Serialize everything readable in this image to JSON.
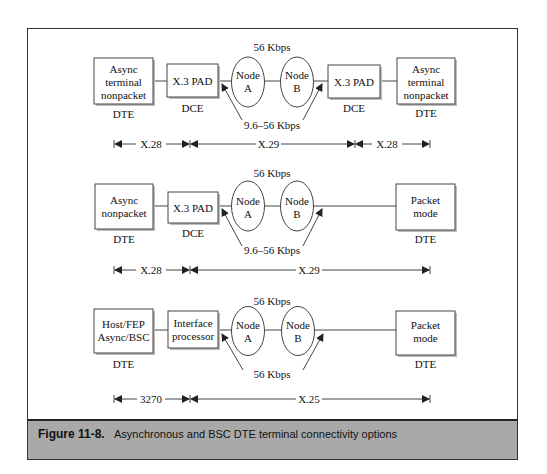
{
  "figure": {
    "number": "Figure 11-8.",
    "caption": "Asynchronous and BSC DTE terminal connectivity options"
  },
  "rows": [
    {
      "top_label": "56 Kbps",
      "access_label": "9.6–56 Kbps",
      "left_device": {
        "lines": [
          "Async",
          "terminal",
          "nonpacket"
        ],
        "role": "DTE"
      },
      "left_interface": {
        "lines": [
          "X.3 PAD"
        ],
        "role": "DCE"
      },
      "node_a": {
        "lines": [
          "Node",
          "A"
        ]
      },
      "node_b": {
        "lines": [
          "Node",
          "B"
        ]
      },
      "right_interface": {
        "lines": [
          "X.3 PAD"
        ],
        "role": "DCE"
      },
      "right_device": {
        "lines": [
          "Async",
          "terminal",
          "nonpacket"
        ],
        "role": "DTE"
      },
      "segments": [
        "X.28",
        "X.29",
        "X.28"
      ]
    },
    {
      "top_label": "56 Kbps",
      "access_label": "9.6–56 Kbps",
      "left_device": {
        "lines": [
          "Async",
          "nonpacket"
        ],
        "role": "DTE"
      },
      "left_interface": {
        "lines": [
          "X.3 PAD"
        ],
        "role": "DCE"
      },
      "node_a": {
        "lines": [
          "Node",
          "A"
        ]
      },
      "node_b": {
        "lines": [
          "Node",
          "B"
        ]
      },
      "right_device": {
        "lines": [
          "Packet",
          "mode"
        ],
        "role": "DTE"
      },
      "segments": [
        "X.28",
        "X.29"
      ]
    },
    {
      "top_label": "56 Kbps",
      "access_label": "56 Kbps",
      "left_device": {
        "lines": [
          "Host/FEP",
          "Async/BSC"
        ],
        "role": "DTE"
      },
      "left_interface": {
        "lines": [
          "Interface",
          "processor"
        ],
        "role": ""
      },
      "node_a": {
        "lines": [
          "Node",
          "A"
        ]
      },
      "node_b": {
        "lines": [
          "Node",
          "B"
        ]
      },
      "right_device": {
        "lines": [
          "Packet",
          "mode"
        ],
        "role": "DTE"
      },
      "segments": [
        "3270",
        "X.25"
      ]
    }
  ]
}
